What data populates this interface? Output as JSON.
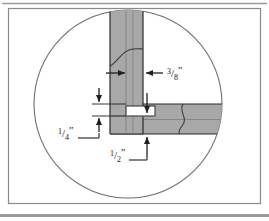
{
  "figure": {
    "name": "woodworking-joint-detail",
    "background_color": "#ffffff",
    "frame": {
      "border_color": "#8a8a8a",
      "bottom_band_color": "#9a9a9a",
      "top_rule_color": "#9a9a9a"
    },
    "detail_circle": {
      "stroke_color": "#6e6e6e",
      "fill_color": "#ffffff",
      "center_x": 128,
      "center_y": 104,
      "radius": 94
    },
    "boards": [
      {
        "name": "vertical-board",
        "fill_color": "#a8a8a8",
        "edge_color": "#3a3a3a",
        "orientation": "vertical"
      },
      {
        "name": "horizontal-board",
        "fill_color": "#a8a8a8",
        "edge_color": "#3a3a3a",
        "orientation": "horizontal"
      },
      {
        "name": "tongue-groove",
        "fill_color": "#ffffff",
        "edge_color": "#3a3a3a"
      }
    ],
    "grain_lines": [
      {
        "name": "vertical-board-grain"
      },
      {
        "name": "horizontal-board-grain"
      }
    ]
  },
  "dimensions": [
    {
      "id": "thickness-3-8",
      "name": "dimension-3-8-inch",
      "numerator": "3",
      "denominator": "8",
      "unit": "″",
      "label": "3/8\"",
      "arrow_style": "double-inward-horizontal"
    },
    {
      "id": "depth-1-4",
      "name": "dimension-1-4-inch",
      "numerator": "1",
      "denominator": "4",
      "unit": "″",
      "label": "1/4\"",
      "arrow_style": "double-vertical-with-leader"
    },
    {
      "id": "width-1-2",
      "name": "dimension-1-2-inch",
      "numerator": "1",
      "denominator": "2",
      "unit": "″",
      "label": "1/2\"",
      "arrow_style": "single-up-with-leader"
    }
  ],
  "colors": {
    "board_fill": "#a8a8a8",
    "board_fill_light": "#b4b4b4",
    "line": "#2b2b2b",
    "circle_stroke": "#6e6e6e",
    "frame": "#8a8a8a"
  }
}
